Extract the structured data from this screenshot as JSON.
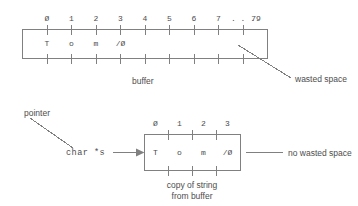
{
  "figure": {
    "line_color": "#808080",
    "text_color": "#4d4d4d",
    "background": "#ffffff"
  },
  "buffer": {
    "indices": [
      "Ø",
      "1",
      "2",
      "3",
      "4",
      "5",
      "6",
      "7",
      ". . .",
      "79"
    ],
    "cells": [
      "T",
      "o",
      "m",
      "/Ø"
    ],
    "label": "buffer",
    "annotation": "wasted space"
  },
  "copy": {
    "pointer_label": "pointer",
    "pointer_decl": "char *s",
    "indices": [
      "Ø",
      "1",
      "2",
      "3"
    ],
    "cells": [
      "T",
      "o",
      "m",
      "/Ø"
    ],
    "annotation": "no wasted space",
    "caption_line1": "copy of string",
    "caption_line2": "from buffer"
  }
}
